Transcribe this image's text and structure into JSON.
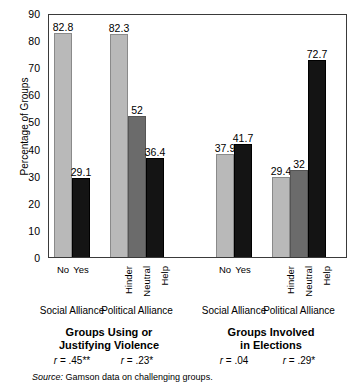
{
  "chart_data": {
    "type": "bar",
    "title": "",
    "xlabel": "",
    "ylabel": "Percentage of Groups",
    "ylim": [
      0,
      90
    ],
    "ytick_step": 10,
    "yticks": [
      "0",
      "10",
      "20",
      "30",
      "40",
      "50",
      "60",
      "70",
      "80",
      "90"
    ],
    "grid": false,
    "legend": "none",
    "panels": [
      {
        "title_line1": "Groups Using or",
        "title_line2": "Justifying Violence",
        "clusters": [
          {
            "group_label": "Social Alliance",
            "label_orientation": "horizontal",
            "stat": "r = .45**",
            "categories": [
              "No",
              "Yes"
            ],
            "values": [
              82.8,
              29.1
            ],
            "value_labels": [
              "82.8",
              "29.1"
            ],
            "shades": [
              "light",
              "dark"
            ]
          },
          {
            "group_label": "Political Alliance",
            "label_orientation": "vertical",
            "stat": "r = .23*",
            "categories": [
              "Hinder",
              "Neutral",
              "Help"
            ],
            "values": [
              82.3,
              52,
              36.4
            ],
            "value_labels": [
              "82.3",
              "52",
              "36.4"
            ],
            "shades": [
              "light",
              "mid",
              "dark"
            ]
          }
        ]
      },
      {
        "title_line1": "Groups Involved",
        "title_line2": "in Elections",
        "clusters": [
          {
            "group_label": "Social Alliance",
            "label_orientation": "horizontal",
            "stat": "r = .04",
            "categories": [
              "No",
              "Yes"
            ],
            "values": [
              37.9,
              41.7
            ],
            "value_labels": [
              "37.9",
              "41.7"
            ],
            "shades": [
              "light",
              "dark"
            ]
          },
          {
            "group_label": "Political Alliance",
            "label_orientation": "vertical",
            "stat": "r = .29*",
            "categories": [
              "Hinder",
              "Neutral",
              "Help"
            ],
            "values": [
              29.4,
              32,
              72.7
            ],
            "value_labels": [
              "29.4",
              "32",
              "72.7"
            ],
            "shades": [
              "light",
              "mid",
              "dark"
            ]
          }
        ]
      }
    ],
    "colors": {
      "light": "#b9b9b9",
      "mid": "#6b6b6b",
      "dark": "#141414",
      "axis": "#3a3a3a",
      "text": "#000000"
    }
  },
  "source": {
    "prefix": "Source:",
    "text": " Gamson data on challenging groups."
  }
}
